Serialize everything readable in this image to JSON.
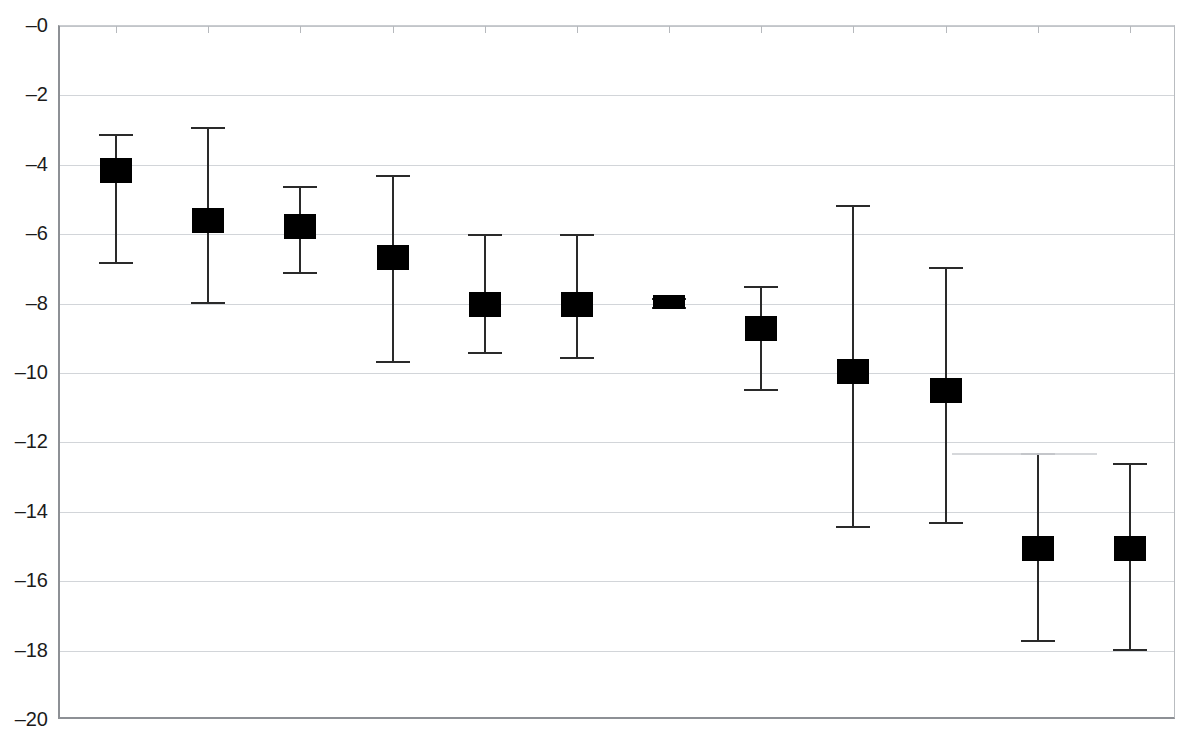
{
  "figure": {
    "background_color": "#ffffff",
    "marker_color": "#000000",
    "gridline_color": "#d2d5d9",
    "axis_color": "#8d9095",
    "clipped_header_text": "                                "
  },
  "axis": {
    "y_tick_labels": [
      "–0",
      "–2",
      "–4",
      "–6",
      "–8",
      "–10",
      "–12",
      "–14",
      "–16",
      "–18",
      "–20"
    ],
    "y_tick_values": [
      0,
      -2,
      -4,
      -6,
      -8,
      -10,
      -12,
      -14,
      -16,
      -18,
      -20
    ],
    "x_tick_count": 12
  },
  "chart_data": {
    "type": "scatter",
    "title": "",
    "subtitle": "",
    "xlabel": "",
    "ylabel": "",
    "ylim": [
      -20,
      0
    ],
    "ytick_step": 2,
    "grid": true,
    "legend": "none",
    "orientation": "vertical",
    "marker_style": "filled-square",
    "error_bar_style": "capped-vertical",
    "categories": [
      "1",
      "2",
      "3",
      "4",
      "5",
      "6",
      "7",
      "8",
      "9",
      "10",
      "11",
      "12"
    ],
    "series": [
      {
        "name": "estimate",
        "values": [
          -4.15,
          -5.6,
          -5.75,
          -6.65,
          -8.0,
          -8.0,
          -7.95,
          -8.7,
          -9.95,
          -10.5,
          -15.05,
          -15.05
        ],
        "err_low": [
          -6.8,
          -7.95,
          -7.1,
          -9.65,
          -9.4,
          -9.55,
          -8.1,
          -10.45,
          -14.4,
          -14.3,
          -17.7,
          -17.95
        ],
        "err_high": [
          -3.1,
          -2.9,
          -4.6,
          -4.3,
          -6.0,
          -6.0,
          -7.85,
          -7.5,
          -5.15,
          -6.95,
          -12.3,
          -12.6
        ]
      }
    ],
    "points": [
      {
        "index": 1,
        "value": -4.15,
        "ci_low": -6.8,
        "ci_high": -3.1
      },
      {
        "index": 2,
        "value": -5.6,
        "ci_low": -7.95,
        "ci_high": -2.9
      },
      {
        "index": 3,
        "value": -5.75,
        "ci_low": -7.1,
        "ci_high": -4.6
      },
      {
        "index": 4,
        "value": -6.65,
        "ci_low": -9.65,
        "ci_high": -4.3
      },
      {
        "index": 5,
        "value": -8.0,
        "ci_low": -9.4,
        "ci_high": -6.0
      },
      {
        "index": 6,
        "value": -8.0,
        "ci_low": -9.55,
        "ci_high": -6.0
      },
      {
        "index": 7,
        "value": -7.95,
        "ci_low": -8.1,
        "ci_high": -7.85
      },
      {
        "index": 8,
        "value": -8.7,
        "ci_low": -10.45,
        "ci_high": -7.5
      },
      {
        "index": 9,
        "value": -9.95,
        "ci_low": -14.4,
        "ci_high": -5.15
      },
      {
        "index": 10,
        "value": -10.5,
        "ci_low": -14.3,
        "ci_high": -6.95
      },
      {
        "index": 11,
        "value": -15.05,
        "ci_low": -17.7,
        "ci_high": -12.3
      },
      {
        "index": 12,
        "value": -15.05,
        "ci_low": -17.95,
        "ci_high": -12.6
      }
    ]
  }
}
